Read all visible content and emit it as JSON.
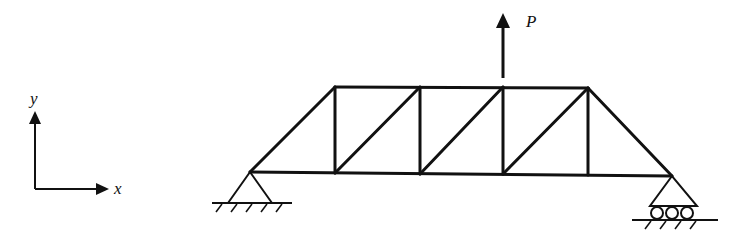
{
  "diagram": {
    "type": "truss",
    "labels": {
      "axis_x": "x",
      "axis_y": "y",
      "load": "P"
    },
    "colors": {
      "stroke": "#111111",
      "background": "#ffffff"
    },
    "nodes": {
      "A": [
        250,
        172
      ],
      "B": [
        335,
        87
      ],
      "C": [
        420,
        87
      ],
      "D": [
        503,
        87
      ],
      "E": [
        588,
        87
      ],
      "F": [
        335,
        173
      ],
      "G": [
        420,
        174
      ],
      "H": [
        503,
        174
      ],
      "I": [
        588,
        175
      ],
      "J": [
        672,
        176
      ]
    },
    "members": [
      [
        "A",
        "B"
      ],
      [
        "B",
        "C"
      ],
      [
        "C",
        "D"
      ],
      [
        "D",
        "E"
      ],
      [
        "E",
        "J"
      ],
      [
        "A",
        "F"
      ],
      [
        "F",
        "G"
      ],
      [
        "G",
        "H"
      ],
      [
        "H",
        "I"
      ],
      [
        "I",
        "J"
      ],
      [
        "B",
        "F"
      ],
      [
        "C",
        "G"
      ],
      [
        "D",
        "H"
      ],
      [
        "E",
        "I"
      ],
      [
        "F",
        "C"
      ],
      [
        "G",
        "D"
      ],
      [
        "H",
        "E"
      ]
    ],
    "supports": [
      {
        "node": "A",
        "type": "pin"
      },
      {
        "node": "J",
        "type": "roller",
        "rollers": 3
      }
    ],
    "loads": [
      {
        "node": "D",
        "direction": "up",
        "label": "P"
      }
    ]
  }
}
